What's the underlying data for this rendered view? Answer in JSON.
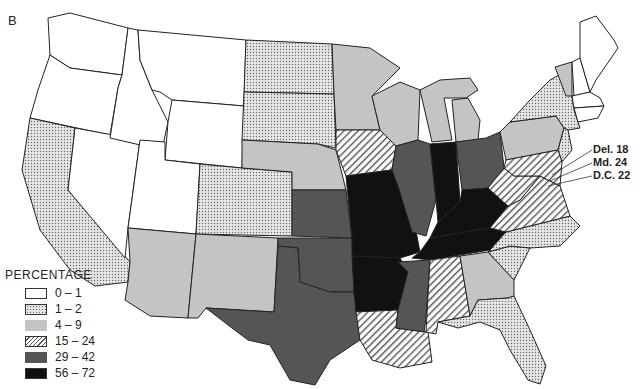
{
  "panel_label": "B",
  "legend": {
    "title": "PERCENTAGE",
    "items": [
      {
        "range": "0 – 1",
        "style": "white"
      },
      {
        "range": "1 – 2",
        "style": "dots"
      },
      {
        "range": "4 – 9",
        "style": "light-gray"
      },
      {
        "range": "15 – 24",
        "style": "hatched"
      },
      {
        "range": "29 – 42",
        "style": "dark-gray"
      },
      {
        "range": "56 – 72",
        "style": "black"
      }
    ]
  },
  "annotations": [
    {
      "label": "Del. 18"
    },
    {
      "label": "Md. 24"
    },
    {
      "label": "D.C. 22"
    }
  ],
  "colors": {
    "white": "#ffffff",
    "dots": "#e0e0e0",
    "light_gray": "#c4c4c4",
    "hatched": "#555555",
    "dark_gray": "#555555",
    "black": "#111111",
    "border": "#222222"
  },
  "states": {
    "WA": "white",
    "OR": "white",
    "CA": "dots",
    "NV": "white",
    "ID": "white",
    "MT": "white",
    "WY": "white",
    "UT": "white",
    "CO": "dots",
    "AZ": "light-gray",
    "NM": "light-gray",
    "ND": "dots",
    "SD": "dots",
    "NE": "light-gray",
    "KS": "dark-gray",
    "OK": "dark-gray",
    "TX": "dark-gray",
    "MN": "light-gray",
    "IA": "hatched",
    "MO": "black",
    "AR": "black",
    "LA": "hatched",
    "WI": "light-gray",
    "IL": "dark-gray",
    "MI": "light-gray",
    "IN": "black",
    "OH": "dark-gray",
    "KY": "black",
    "TN": "black",
    "MS": "dark-gray",
    "AL": "hatched",
    "GA": "light-gray",
    "FL": "dots",
    "SC": "dots",
    "NC": "dots",
    "VA": "hatched",
    "WV": "hatched",
    "PA": "light-gray",
    "NY": "dots",
    "VT": "light-gray",
    "NH": "white",
    "ME": "white",
    "MA": "white",
    "CT": "white",
    "RI": "white",
    "NJ": "dots"
  }
}
